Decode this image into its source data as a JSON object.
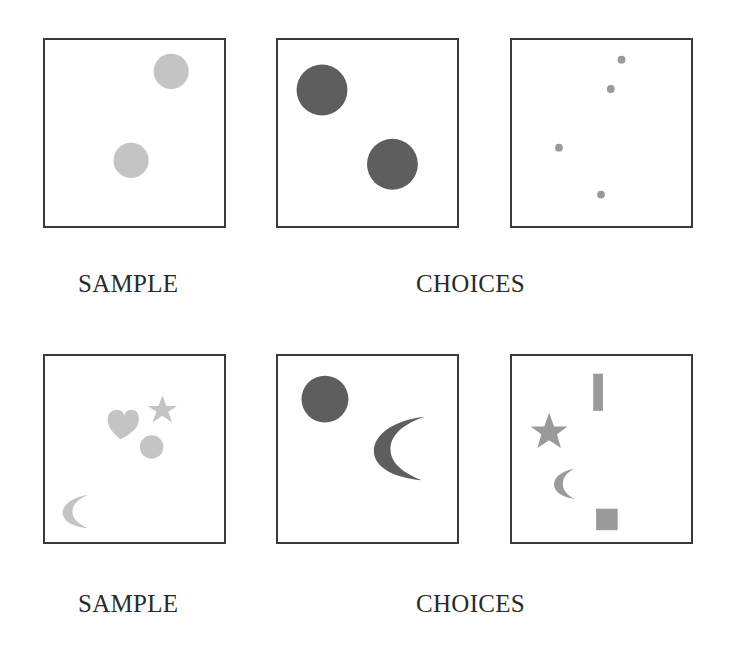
{
  "colors": {
    "light_gray": "#c4c4c4",
    "mid_gray": "#9a9a9a",
    "dark_gray": "#5e5e5e",
    "border": "#3a3a3a"
  },
  "rows": [
    {
      "sample_label": "SAMPLE",
      "choices_label": "CHOICES",
      "panels": [
        {
          "role": "sample",
          "shapes": [
            {
              "type": "circle",
              "cx": 129,
              "cy": 32,
              "r": 18,
              "fill": "light"
            },
            {
              "type": "circle",
              "cx": 88,
              "cy": 123,
              "r": 18,
              "fill": "light"
            }
          ]
        },
        {
          "role": "choice-1",
          "shapes": [
            {
              "type": "circle",
              "cx": 45,
              "cy": 51,
              "r": 26,
              "fill": "dark"
            },
            {
              "type": "circle",
              "cx": 117,
              "cy": 127,
              "r": 26,
              "fill": "dark"
            }
          ]
        },
        {
          "role": "choice-2",
          "shapes": [
            {
              "type": "circle",
              "cx": 112,
              "cy": 20,
              "r": 4,
              "fill": "mid"
            },
            {
              "type": "circle",
              "cx": 101,
              "cy": 50,
              "r": 4,
              "fill": "mid"
            },
            {
              "type": "circle",
              "cx": 48,
              "cy": 110,
              "r": 4,
              "fill": "mid"
            },
            {
              "type": "circle",
              "cx": 91,
              "cy": 158,
              "r": 4,
              "fill": "mid"
            }
          ]
        }
      ]
    },
    {
      "sample_label": "SAMPLE",
      "choices_label": "CHOICES",
      "panels": [
        {
          "role": "sample",
          "shapes": [
            "heart",
            "star",
            "circle",
            "crescent"
          ]
        },
        {
          "role": "choice-1",
          "shapes": [
            "circle",
            "crescent"
          ]
        },
        {
          "role": "choice-2",
          "shapes": [
            "bar",
            "star",
            "crescent",
            "square"
          ]
        }
      ]
    }
  ]
}
